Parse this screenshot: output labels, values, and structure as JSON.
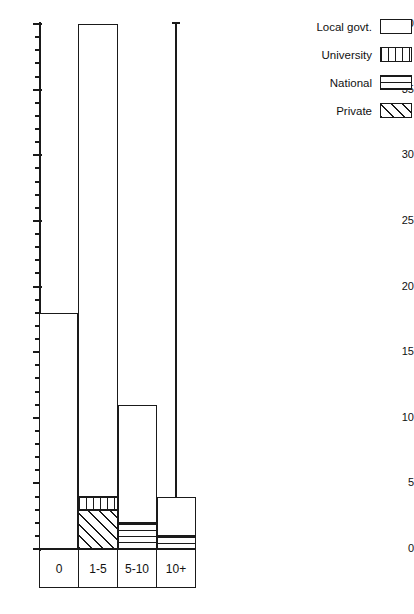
{
  "chart_data": {
    "type": "bar",
    "subtype": "stacked-vertical",
    "title": "",
    "xlabel": "",
    "ylabel": "",
    "ylim": [
      0,
      40
    ],
    "ytick_major_step": 5,
    "ytick_minor_step": 1,
    "grid": false,
    "legend_position": "top-right",
    "axis_break_note": "10+ bar exceeds the 40 axis maximum and is drawn as an overflow spike",
    "categories": [
      "0",
      "1-5",
      "5-10",
      "10+"
    ],
    "ytick_labels": [
      "0",
      "5",
      "10",
      "15",
      "20",
      "25",
      "30",
      "35",
      "40"
    ],
    "series": [
      {
        "name": "Local govt.",
        "pattern": "blank",
        "values": [
          18,
          36,
          9,
          3
        ]
      },
      {
        "name": "University",
        "pattern": "vertical-stripes",
        "values": [
          0,
          1,
          0,
          0
        ]
      },
      {
        "name": "National",
        "pattern": "horizontal-stripes",
        "values": [
          0,
          0,
          2,
          1
        ]
      },
      {
        "name": "Private",
        "pattern": "diagonal-hatch",
        "values": [
          0,
          3,
          0,
          0
        ]
      }
    ],
    "totals": [
      18,
      40,
      11,
      40
    ]
  },
  "legend": {
    "items": [
      {
        "label": "Local govt.",
        "pattern": "blank"
      },
      {
        "label": "University",
        "pattern": "vertical-stripes"
      },
      {
        "label": "National",
        "pattern": "horizontal-stripes"
      },
      {
        "label": "Private",
        "pattern": "diagonal-hatch"
      }
    ]
  },
  "caption": {
    "text": ""
  }
}
